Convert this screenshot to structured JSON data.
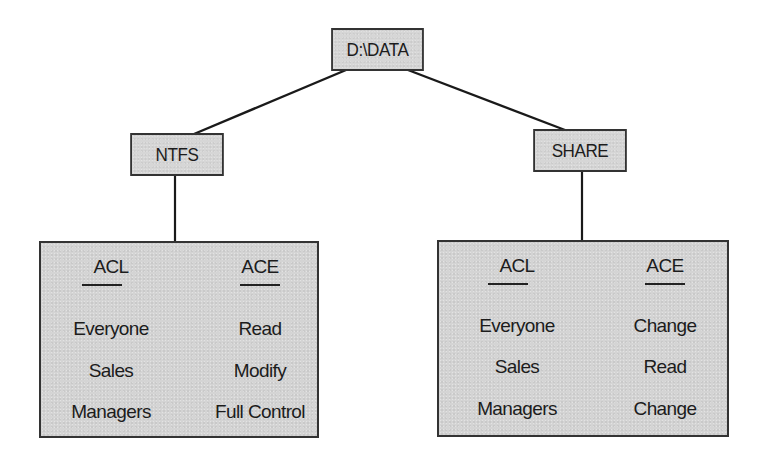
{
  "diagram": {
    "root": {
      "label": "D:\\DATA"
    },
    "branches": [
      {
        "label": "NTFS",
        "table": {
          "headers": [
            "ACL",
            "ACE"
          ],
          "rows": [
            {
              "acl": "Everyone",
              "ace": "Read"
            },
            {
              "acl": "Sales",
              "ace": "Modify"
            },
            {
              "acl": "Managers",
              "ace": "Full Control"
            }
          ]
        }
      },
      {
        "label": "SHARE",
        "table": {
          "headers": [
            "ACL",
            "ACE"
          ],
          "rows": [
            {
              "acl": "Everyone",
              "ace": "Change"
            },
            {
              "acl": "Sales",
              "ace": "Read"
            },
            {
              "acl": "Managers",
              "ace": "Change"
            }
          ]
        }
      }
    ],
    "edges": [
      {
        "from": "D:\\DATA",
        "to": "NTFS"
      },
      {
        "from": "D:\\DATA",
        "to": "SHARE"
      },
      {
        "from": "NTFS",
        "to": "NTFS ACL/ACE table"
      },
      {
        "from": "SHARE",
        "to": "SHARE ACL/ACE table"
      }
    ],
    "colors": {
      "box_fill": "#d6d6d6",
      "box_border": "#333333",
      "line": "#1a1a1a",
      "text": "#1c1c1c",
      "background": "#ffffff"
    }
  }
}
